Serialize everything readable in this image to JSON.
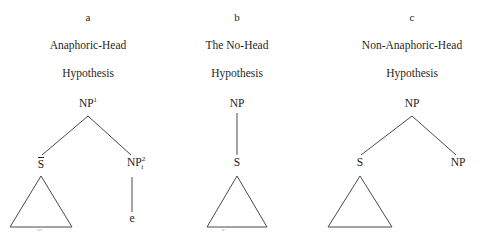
{
  "figure": {
    "background_color": "#ffffff",
    "ink_color": "#1b1b1b",
    "line_color": "#4a4a4a"
  },
  "columns": [
    {
      "letter": "a",
      "title_line1": "Anaphoric-Head",
      "title_line2": "Hypothesis",
      "tree": {
        "root": {
          "base": "NP",
          "sup": "1"
        },
        "left_child": {
          "base": "S",
          "overbar": true
        },
        "right_child": {
          "base": "NP",
          "sup": "2",
          "sub": "i"
        },
        "terminal": "e",
        "has_left_triangle": true,
        "has_right_triangle": false
      }
    },
    {
      "letter": "b",
      "title_line1": "The No-Head",
      "title_line2": "Hypothesis",
      "tree": {
        "root": {
          "base": "NP"
        },
        "only_child": {
          "base": "S"
        },
        "has_left_triangle": true
      }
    },
    {
      "letter": "c",
      "title_line1": "Non-Anaphoric-Head",
      "title_line2": "Hypothesis",
      "tree": {
        "root": {
          "base": "NP"
        },
        "left_child": {
          "base": "S"
        },
        "right_child": {
          "base": "NP"
        },
        "has_left_triangle": true
      }
    }
  ],
  "caption": {
    "cut_off_text": "Figure 1. Possible structures of Non-null Subject relative clauses"
  }
}
